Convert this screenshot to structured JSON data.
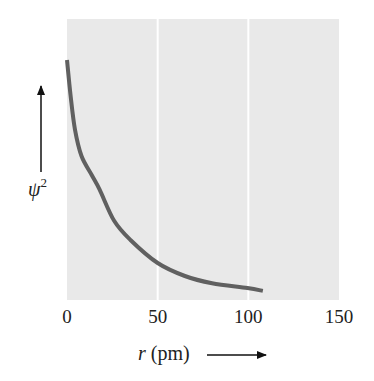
{
  "chart_data": {
    "type": "line",
    "title": "",
    "xlabel": "r (pm)",
    "ylabel": "ψ²",
    "ylabel_base": "ψ",
    "ylabel_sup": "2",
    "xlabel_var": "r",
    "xlabel_unit": "(pm)",
    "xlim": [
      0,
      150
    ],
    "ylim": [
      0,
      1.17
    ],
    "x_ticks": [
      0,
      50,
      100,
      150
    ],
    "x_tick_labels": [
      "0",
      "50",
      "100",
      "150"
    ],
    "y_ticks": [],
    "grid": {
      "x": true,
      "y": false,
      "color": "#ffffff",
      "positions": [
        50,
        100
      ]
    },
    "legend": null,
    "background": "#e9e9e9",
    "series": [
      {
        "name": "ψ² (relative probability)",
        "color": "#606060",
        "x": [
          0,
          2,
          4.4,
          8,
          13.7,
          18,
          26,
          35,
          50,
          65,
          80,
          99.5,
          108
        ],
        "y": [
          1.0,
          0.85,
          0.71,
          0.6,
          0.52,
          0.46,
          0.33,
          0.25,
          0.154,
          0.1,
          0.07,
          0.05,
          0.038
        ]
      }
    ]
  }
}
